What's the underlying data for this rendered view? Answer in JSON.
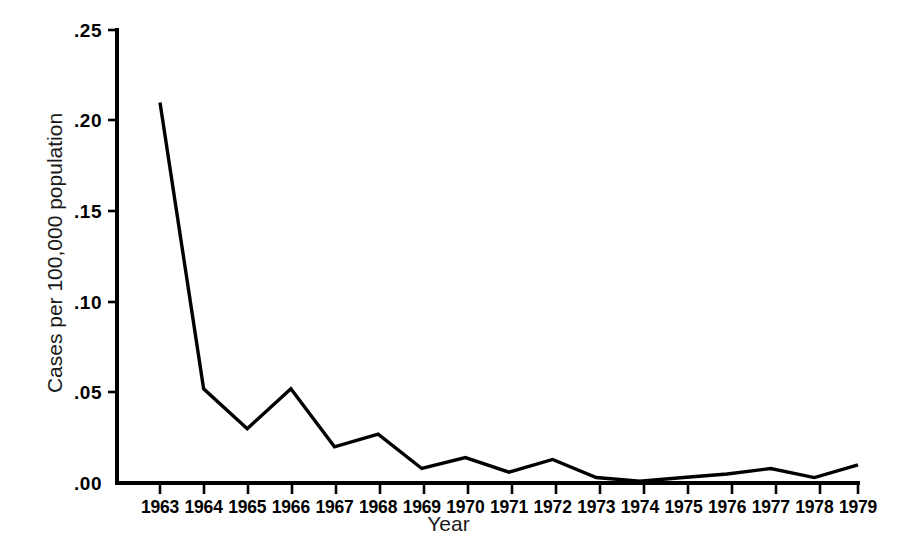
{
  "chart_data": {
    "type": "line",
    "title": "",
    "subtitle": "",
    "xlabel": "Year",
    "ylabel": "Cases per 100,000 population",
    "categories": [
      "1963",
      "1964",
      "1965",
      "1966",
      "1967",
      "1968",
      "1969",
      "1970",
      "1971",
      "1972",
      "1973",
      "1974",
      "1975",
      "1976",
      "1977",
      "1978",
      "1979"
    ],
    "x": [
      1963,
      1964,
      1965,
      1966,
      1967,
      1968,
      1969,
      1970,
      1971,
      1972,
      1973,
      1974,
      1975,
      1976,
      1977,
      1978,
      1979
    ],
    "values": [
      0.21,
      0.052,
      0.03,
      0.052,
      0.02,
      0.027,
      0.008,
      0.014,
      0.006,
      0.013,
      0.003,
      0.001,
      0.003,
      0.005,
      0.008,
      0.003,
      0.01
    ],
    "series": [
      {
        "name": "Cases per 100,000 population",
        "values": [
          0.21,
          0.052,
          0.03,
          0.052,
          0.02,
          0.027,
          0.008,
          0.014,
          0.006,
          0.013,
          0.003,
          0.001,
          0.003,
          0.005,
          0.008,
          0.003,
          0.01
        ]
      }
    ],
    "ylim": [
      0.0,
      0.25
    ],
    "xlim": [
      1963,
      1979
    ],
    "yticks": [
      0.0,
      0.05,
      0.1,
      0.15,
      0.2,
      0.25
    ],
    "ytick_labels": [
      ".00",
      ".05",
      ".10",
      ".15",
      ".20",
      ".25"
    ],
    "xtick_labels": [
      "1963",
      "1964",
      "1965",
      "1966",
      "1967",
      "1968",
      "1969",
      "1970",
      "1971",
      "1972",
      "1973",
      "1974",
      "1975",
      "1976",
      "1977",
      "1978",
      "1979"
    ],
    "grid": false,
    "legend": false,
    "legend_position": "none",
    "line_color": "#000000",
    "background_color": "#ffffff",
    "annotations": []
  },
  "axes": {
    "y_title": "Cases per 100,000 population",
    "x_title": "Year"
  }
}
